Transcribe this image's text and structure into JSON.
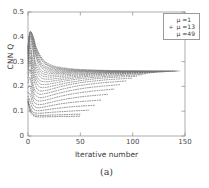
{
  "chart_data": {
    "type": "line",
    "title": "",
    "caption": "(a)",
    "xlabel": "Iterative number",
    "ylabel": "CNN Q",
    "xlim": [
      0,
      150
    ],
    "ylim": [
      0,
      0.5
    ],
    "xticks": [
      0,
      50,
      100,
      150
    ],
    "yticks": [
      0,
      0.1,
      0.2,
      0.3,
      0.4,
      0.5
    ],
    "xtick_labels": [
      "0",
      "50",
      "100",
      "150"
    ],
    "ytick_labels": [
      "0",
      "0.1",
      "0.2",
      "0.3",
      "0.4",
      "0.5"
    ],
    "grid": false,
    "linestyle": "dotted",
    "legend_position": "upper right",
    "legend": [
      {
        "label": "μ =1",
        "marker": ""
      },
      {
        "label": "μ =13",
        "marker": "+"
      },
      {
        "label": "μ =49",
        "marker": ""
      }
    ],
    "series": [
      {
        "name": "μ =1",
        "x": [
          0,
          2,
          4,
          6,
          8,
          11,
          15,
          20,
          26,
          33,
          41,
          50
        ],
        "values": [
          0.135,
          0.1,
          0.086,
          0.08,
          0.078,
          0.077,
          0.077,
          0.078,
          0.078,
          0.079,
          0.079,
          0.08
        ]
      },
      {
        "name": "μ =3",
        "x": [
          0,
          2,
          4,
          6,
          8,
          11,
          15,
          20,
          26,
          33,
          41,
          50
        ],
        "values": [
          0.14,
          0.107,
          0.092,
          0.086,
          0.084,
          0.083,
          0.083,
          0.084,
          0.085,
          0.086,
          0.087,
          0.088
        ]
      },
      {
        "name": "μ =5",
        "x": [
          0,
          2,
          4,
          6,
          9,
          13,
          18,
          24,
          31,
          39,
          48,
          58
        ],
        "values": [
          0.148,
          0.118,
          0.1,
          0.094,
          0.092,
          0.092,
          0.094,
          0.096,
          0.098,
          0.1,
          0.102,
          0.104
        ]
      },
      {
        "name": "μ =7",
        "x": [
          0,
          2,
          4,
          6,
          9,
          13,
          18,
          25,
          33,
          42,
          52,
          64
        ],
        "values": [
          0.16,
          0.14,
          0.116,
          0.106,
          0.102,
          0.103,
          0.106,
          0.11,
          0.114,
          0.118,
          0.121,
          0.124
        ]
      },
      {
        "name": "μ =9",
        "x": [
          0,
          2,
          4,
          6,
          9,
          13,
          19,
          26,
          35,
          45,
          57,
          70
        ],
        "values": [
          0.175,
          0.168,
          0.136,
          0.12,
          0.114,
          0.115,
          0.12,
          0.126,
          0.132,
          0.137,
          0.141,
          0.145
        ]
      },
      {
        "name": "μ =11",
        "x": [
          0,
          2,
          4,
          6,
          9,
          14,
          20,
          28,
          38,
          49,
          62,
          76
        ],
        "values": [
          0.195,
          0.2,
          0.16,
          0.136,
          0.128,
          0.128,
          0.134,
          0.142,
          0.15,
          0.157,
          0.163,
          0.168
        ]
      },
      {
        "name": "μ =13",
        "x": [
          0,
          2,
          4,
          6,
          9,
          14,
          21,
          29,
          40,
          52,
          66,
          82
        ],
        "values": [
          0.215,
          0.235,
          0.186,
          0.154,
          0.142,
          0.142,
          0.149,
          0.158,
          0.168,
          0.176,
          0.183,
          0.189
        ]
      },
      {
        "name": "μ =15",
        "x": [
          0,
          2,
          4,
          6,
          10,
          15,
          22,
          31,
          43,
          56,
          71,
          88
        ],
        "values": [
          0.235,
          0.268,
          0.212,
          0.172,
          0.156,
          0.156,
          0.164,
          0.174,
          0.185,
          0.194,
          0.201,
          0.207
        ]
      },
      {
        "name": "μ =17",
        "x": [
          0,
          2,
          4,
          6,
          10,
          15,
          23,
          33,
          45,
          59,
          75,
          94
        ],
        "values": [
          0.252,
          0.296,
          0.238,
          0.19,
          0.17,
          0.17,
          0.178,
          0.189,
          0.2,
          0.209,
          0.216,
          0.222
        ]
      },
      {
        "name": "μ =19",
        "x": [
          0,
          2,
          4,
          7,
          10,
          16,
          24,
          34,
          47,
          62,
          79,
          99
        ],
        "values": [
          0.268,
          0.32,
          0.262,
          0.208,
          0.184,
          0.183,
          0.191,
          0.202,
          0.213,
          0.221,
          0.228,
          0.233
        ]
      },
      {
        "name": "μ =21",
        "x": [
          0,
          2,
          4,
          7,
          11,
          17,
          25,
          36,
          50,
          65,
          83,
          104
        ],
        "values": [
          0.282,
          0.34,
          0.284,
          0.226,
          0.198,
          0.196,
          0.203,
          0.213,
          0.223,
          0.231,
          0.237,
          0.241
        ]
      },
      {
        "name": "μ =23",
        "x": [
          0,
          2,
          4,
          7,
          11,
          17,
          26,
          37,
          52,
          68,
          87,
          109
        ],
        "values": [
          0.294,
          0.358,
          0.303,
          0.243,
          0.212,
          0.208,
          0.214,
          0.223,
          0.232,
          0.238,
          0.243,
          0.247
        ]
      },
      {
        "name": "μ =25",
        "x": [
          0,
          2,
          4,
          7,
          11,
          18,
          27,
          39,
          54,
          71,
          90,
          113
        ],
        "values": [
          0.304,
          0.372,
          0.32,
          0.259,
          0.225,
          0.219,
          0.224,
          0.231,
          0.239,
          0.244,
          0.248,
          0.251
        ]
      },
      {
        "name": "μ =27",
        "x": [
          0,
          2,
          5,
          7,
          12,
          18,
          28,
          40,
          56,
          73,
          93,
          117
        ],
        "values": [
          0.313,
          0.384,
          0.335,
          0.274,
          0.237,
          0.229,
          0.232,
          0.238,
          0.244,
          0.249,
          0.252,
          0.254
        ]
      },
      {
        "name": "μ =29",
        "x": [
          0,
          2,
          5,
          7,
          12,
          19,
          29,
          42,
          58,
          76,
          96,
          121
        ],
        "values": [
          0.321,
          0.394,
          0.348,
          0.288,
          0.248,
          0.238,
          0.24,
          0.244,
          0.249,
          0.252,
          0.254,
          0.256
        ]
      },
      {
        "name": "μ =31",
        "x": [
          0,
          2,
          5,
          7,
          12,
          19,
          30,
          43,
          60,
          78,
          99,
          124
        ],
        "values": [
          0.328,
          0.402,
          0.359,
          0.3,
          0.258,
          0.246,
          0.246,
          0.249,
          0.252,
          0.255,
          0.256,
          0.257
        ]
      },
      {
        "name": "μ =33",
        "x": [
          0,
          2,
          5,
          8,
          12,
          20,
          31,
          44,
          61,
          80,
          102,
          128
        ],
        "values": [
          0.334,
          0.408,
          0.368,
          0.311,
          0.267,
          0.253,
          0.252,
          0.253,
          0.255,
          0.257,
          0.258,
          0.258
        ]
      },
      {
        "name": "μ =35",
        "x": [
          0,
          2,
          5,
          8,
          13,
          20,
          32,
          45,
          63,
          82,
          104,
          131
        ],
        "values": [
          0.339,
          0.412,
          0.376,
          0.32,
          0.275,
          0.259,
          0.256,
          0.257,
          0.258,
          0.258,
          0.259,
          0.259
        ]
      },
      {
        "name": "μ =37",
        "x": [
          0,
          2,
          5,
          8,
          13,
          21,
          32,
          46,
          64,
          84,
          106,
          133
        ],
        "values": [
          0.344,
          0.415,
          0.382,
          0.328,
          0.282,
          0.264,
          0.26,
          0.259,
          0.259,
          0.259,
          0.26,
          0.26
        ]
      },
      {
        "name": "μ =39",
        "x": [
          0,
          2,
          5,
          8,
          13,
          21,
          33,
          47,
          66,
          86,
          108,
          136
        ],
        "values": [
          0.348,
          0.417,
          0.387,
          0.335,
          0.288,
          0.269,
          0.263,
          0.261,
          0.261,
          0.26,
          0.26,
          0.26
        ]
      },
      {
        "name": "μ =41",
        "x": [
          0,
          2,
          5,
          8,
          13,
          21,
          34,
          48,
          67,
          87,
          110,
          138
        ],
        "values": [
          0.352,
          0.418,
          0.391,
          0.341,
          0.294,
          0.273,
          0.266,
          0.263,
          0.262,
          0.261,
          0.261,
          0.261
        ]
      },
      {
        "name": "μ =43",
        "x": [
          0,
          2,
          5,
          8,
          14,
          22,
          34,
          49,
          68,
          89,
          112,
          140
        ],
        "values": [
          0.355,
          0.419,
          0.394,
          0.346,
          0.299,
          0.277,
          0.268,
          0.264,
          0.263,
          0.262,
          0.261,
          0.261
        ]
      },
      {
        "name": "μ =45",
        "x": [
          0,
          2,
          5,
          8,
          14,
          22,
          35,
          50,
          69,
          90,
          113,
          142
        ],
        "values": [
          0.358,
          0.42,
          0.397,
          0.35,
          0.303,
          0.28,
          0.27,
          0.266,
          0.264,
          0.262,
          0.262,
          0.261
        ]
      },
      {
        "name": "μ =47",
        "x": [
          0,
          2,
          5,
          8,
          14,
          22,
          35,
          50,
          70,
          91,
          114,
          143
        ],
        "values": [
          0.36,
          0.42,
          0.399,
          0.354,
          0.307,
          0.283,
          0.272,
          0.267,
          0.264,
          0.263,
          0.262,
          0.262
        ]
      },
      {
        "name": "μ =49",
        "x": [
          0,
          2,
          5,
          8,
          14,
          23,
          36,
          51,
          71,
          92,
          115,
          145
        ],
        "values": [
          0.362,
          0.42,
          0.401,
          0.357,
          0.31,
          0.285,
          0.274,
          0.268,
          0.265,
          0.263,
          0.262,
          0.262
        ]
      }
    ]
  }
}
